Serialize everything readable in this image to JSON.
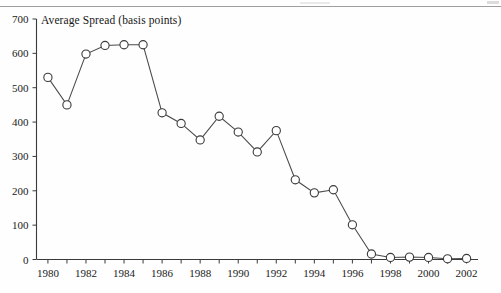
{
  "figure": {
    "title": "Average Spread (basis points)",
    "background_color": "#fefefe",
    "line_color": "#4a4a4a",
    "marker_fill": "#ffffff",
    "marker_stroke": "#3a3a3a",
    "axis_color": "#3a3a3a",
    "scan_artifact_color": "#8d8d8d"
  },
  "chart_data": {
    "type": "line",
    "title": "Average Spread (basis points)",
    "xlabel": "",
    "ylabel": "",
    "ylim": [
      0,
      700
    ],
    "xlim": [
      1979.4,
      2002.6
    ],
    "grid": false,
    "legend": "none",
    "marker": "open-circle",
    "y_ticks": [
      0,
      100,
      200,
      300,
      400,
      500,
      600,
      700
    ],
    "y_tick_labels": [
      "0",
      "100",
      "200",
      "300",
      "400",
      "500",
      "600",
      "700"
    ],
    "x_ticks": [
      1980,
      1981,
      1982,
      1983,
      1984,
      1985,
      1986,
      1987,
      1988,
      1989,
      1990,
      1991,
      1992,
      1993,
      1994,
      1995,
      1996,
      1997,
      1998,
      1999,
      2000,
      2001,
      2002
    ],
    "x_tick_labels": [
      "1980",
      "",
      "1982",
      "",
      "1984",
      "",
      "1986",
      "",
      "1988",
      "",
      "1990",
      "",
      "1992",
      "",
      "1994",
      "",
      "1996",
      "",
      "1998",
      "",
      "2000",
      "",
      "2002"
    ],
    "x_labeled_ticks": [
      1980,
      1982,
      1984,
      1986,
      1988,
      1990,
      1992,
      1994,
      1996,
      1998,
      2000,
      2002
    ],
    "x": [
      1980,
      1981,
      1982,
      1983,
      1984,
      1985,
      1986,
      1987,
      1988,
      1989,
      1990,
      1991,
      1992,
      1993,
      1994,
      1995,
      1996,
      1997,
      1998,
      1999,
      2000,
      2001,
      2002
    ],
    "values": [
      530,
      450,
      598,
      623,
      625,
      625,
      427,
      396,
      348,
      417,
      371,
      313,
      375,
      232,
      194,
      203,
      101,
      16,
      6,
      7,
      6,
      2,
      3
    ],
    "series": [
      {
        "name": "Average Spread",
        "units": "basis points",
        "values": [
          530,
          450,
          598,
          623,
          625,
          625,
          427,
          396,
          348,
          417,
          371,
          313,
          375,
          232,
          194,
          203,
          101,
          16,
          6,
          7,
          6,
          2,
          3
        ]
      }
    ]
  }
}
